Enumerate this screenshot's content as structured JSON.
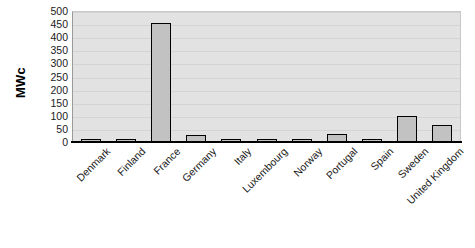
{
  "chart_data": {
    "type": "bar",
    "title": "",
    "subtitle": "",
    "xlabel": "",
    "ylabel": "MWc",
    "ylim": [
      0,
      500
    ],
    "yticks": [
      0,
      50,
      100,
      150,
      200,
      250,
      300,
      350,
      400,
      450,
      500
    ],
    "ytick_labels": [
      "0",
      "50",
      "100",
      "150",
      "200",
      "250",
      "300",
      "350",
      "400",
      "450",
      "500"
    ],
    "grid": true,
    "legend": null,
    "legend_position": "none",
    "categories": [
      "Denmark",
      "Finland",
      "France",
      "Germany",
      "Italy",
      "Luxembourg",
      "Norway",
      "Portugal",
      "Spain",
      "Sweden",
      "United Kingdom"
    ],
    "values": [
      12,
      12,
      455,
      25,
      10,
      10,
      10,
      30,
      10,
      100,
      65
    ],
    "colors": {
      "bar_fill": "#c2c2c2",
      "bar_border": "#000000",
      "plot_background": "#e2e2e2",
      "figure_background": "#ffffff",
      "gridline": "#d4d4d4",
      "axis": "#000000",
      "text": "#1a1a1a"
    }
  }
}
